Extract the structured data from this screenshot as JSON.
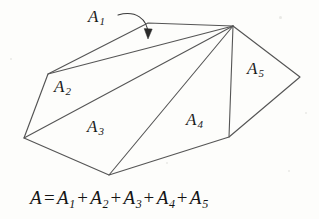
{
  "figure": {
    "background_color": "#fdfdfb",
    "stroke_color": "#555555",
    "text_color": "#141414",
    "labels": [
      {
        "id": "A1",
        "text": "A",
        "subscript": "1",
        "x": 88,
        "y": 8
      },
      {
        "id": "A2",
        "text": "A",
        "subscript": "2",
        "x": 54,
        "y": 78
      },
      {
        "id": "A3",
        "text": "A",
        "subscript": "3",
        "x": 87,
        "y": 118
      },
      {
        "id": "A4",
        "text": "A",
        "subscript": "4",
        "x": 186,
        "y": 111
      },
      {
        "id": "A5",
        "text": "A",
        "subscript": "5",
        "x": 247,
        "y": 60
      }
    ],
    "equation": {
      "lhs": "A",
      "equals": "=",
      "terms": [
        "A",
        "A",
        "A",
        "A",
        "A"
      ],
      "subscripts": [
        "1",
        "2",
        "3",
        "4",
        "5"
      ],
      "operator": "+",
      "full_text": "A = A1 + A2 + A3 + A4 + A5"
    },
    "annotation_arrow": {
      "id": "a1-pointer",
      "description": "curved arrow from the A1 label to the thin top sliver region",
      "path": "M 118 15 C 134 11 146 20 148 34",
      "tip_x": 148,
      "tip_y": 37
    },
    "geometry": {
      "vertices": {
        "apex": {
          "x": 233,
          "y": 26
        },
        "top_left": {
          "x": 148,
          "y": 23
        },
        "left": {
          "x": 48,
          "y": 74
        },
        "left_bottom": {
          "x": 24,
          "y": 138
        },
        "bottom": {
          "x": 109,
          "y": 175
        },
        "bottom_right": {
          "x": 229,
          "y": 137
        },
        "right": {
          "x": 300,
          "y": 77
        }
      },
      "outline": "apex -> top_left -> left -> left_bottom -> bottom -> bottom_right -> right -> apex",
      "fan_edges": [
        "apex -> left",
        "apex -> left_bottom",
        "apex -> bottom",
        "apex -> bottom_right"
      ],
      "regions": [
        {
          "id": "A1",
          "vertices": [
            "apex",
            "top_left",
            "left"
          ]
        },
        {
          "id": "A2",
          "vertices": [
            "apex",
            "left",
            "left_bottom"
          ]
        },
        {
          "id": "A3",
          "vertices": [
            "apex",
            "left_bottom",
            "bottom"
          ]
        },
        {
          "id": "A4",
          "vertices": [
            "apex",
            "bottom",
            "bottom_right"
          ]
        },
        {
          "id": "A5",
          "vertices": [
            "apex",
            "bottom_right",
            "right"
          ]
        }
      ]
    }
  }
}
